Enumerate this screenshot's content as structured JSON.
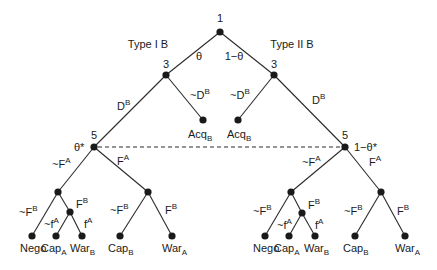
{
  "diagram": {
    "type": "extensive-form game tree",
    "root": {
      "player": "1"
    },
    "branches": {
      "left_type": "Type I B",
      "right_type": "Type II B",
      "left_prob": "θ",
      "right_prob": "1−θ"
    },
    "level2": {
      "left_player": "3",
      "right_player": "3",
      "left_edges": {
        "down": "D",
        "down_sup": "B",
        "acq": "~D",
        "acq_sup": "B"
      },
      "right_edges": {
        "down": "D",
        "down_sup": "B",
        "acq": "~D",
        "acq_sup": "B"
      },
      "acq_label": "Acq",
      "acq_sub": "B"
    },
    "level3": {
      "left_player": "5",
      "right_player": "5",
      "left_belief": "θ*",
      "right_belief": "1−θ*",
      "info_set": "dashed line connecting player 5 nodes"
    },
    "subtree": {
      "edge_notFA": "~F",
      "edge_FA": "F",
      "sup_A": "A",
      "edge_notFB": "~F",
      "edge_FB": "F",
      "sup_B": "B",
      "edge_notfA": "~f",
      "edge_fA": "f",
      "leaves": [
        {
          "label": "Nego",
          "sub": ""
        },
        {
          "label": "Cap",
          "sub": "A"
        },
        {
          "label": "War",
          "sub": "B"
        },
        {
          "label": "Cap",
          "sub": "B"
        },
        {
          "label": "War",
          "sub": "A"
        }
      ]
    }
  }
}
